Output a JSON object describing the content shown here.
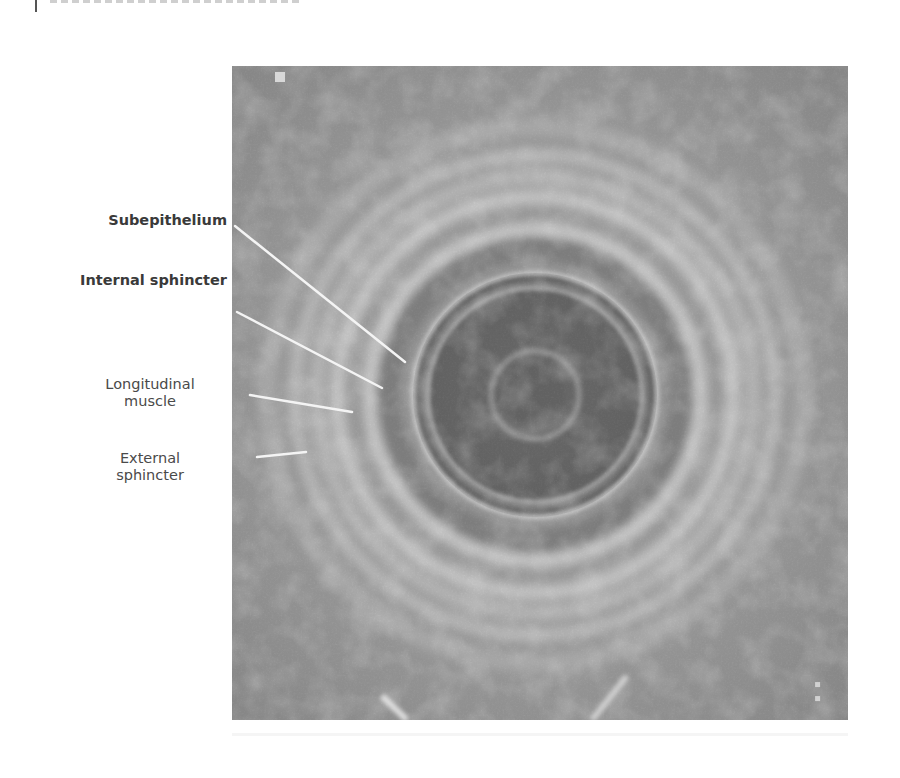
{
  "page": {
    "header_clipped": true,
    "background": "#ffffff"
  },
  "figure": {
    "type": "endoanal-ultrasound",
    "colors": {
      "lumen": "#5e5e5e",
      "probe_center": "#6a6a6a",
      "bright_ring": "#d6d6d6",
      "tissue": "#a8a8a8",
      "outer": "#8f8f8f",
      "leader_line": "#f2f2f2",
      "label_text": "#444444"
    },
    "corner_marker_icon": "square-marker-icon",
    "scale_marker_icon": "rotated-scale-text-icon"
  },
  "labels": [
    {
      "id": "subepithelium",
      "text": "Subepithelium",
      "lines": [
        "Subepithelium"
      ],
      "bold": true
    },
    {
      "id": "internal-sphincter",
      "text": "Internal sphincter",
      "lines": [
        "Internal sphincter"
      ],
      "bold": true
    },
    {
      "id": "longitudinal-muscle",
      "text": "Longitudinal muscle",
      "lines": [
        "Longitudinal",
        "muscle"
      ],
      "bold": false
    },
    {
      "id": "external-sphincter",
      "text": "External sphincter",
      "lines": [
        "External",
        "sphincter"
      ],
      "bold": false
    }
  ]
}
